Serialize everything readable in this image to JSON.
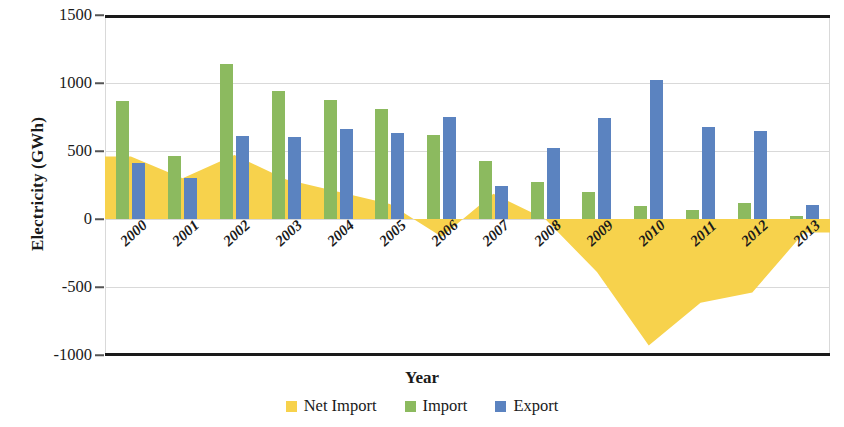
{
  "chart_data": {
    "type": "bar",
    "title": "",
    "xlabel": "Year",
    "ylabel": "Electricity  (GWh)",
    "ylim": [
      -1000,
      1500
    ],
    "ytick_values": [
      1500,
      1000,
      500,
      0,
      -500,
      -1000
    ],
    "ytick_labels": [
      "1500",
      "1000",
      "500",
      "0",
      "-500",
      "-1000"
    ],
    "grid": true,
    "legend_position": "bottom",
    "categories": [
      "2000",
      "2001",
      "2002",
      "2003",
      "2004",
      "2005",
      "2006",
      "2007",
      "2008",
      "2009",
      "2010",
      "2011",
      "2012",
      "2013"
    ],
    "series": [
      {
        "name": "Net Import",
        "type": "area",
        "color": "#f7d24c",
        "values": [
          460,
          300,
          470,
          290,
          200,
          110,
          -130,
          185,
          0,
          -390,
          -930,
          -615,
          -540,
          -100
        ]
      },
      {
        "name": "Import",
        "type": "bar",
        "color": "#8cba5f",
        "values": [
          865,
          460,
          1140,
          940,
          875,
          810,
          620,
          425,
          270,
          195,
          95,
          65,
          115,
          25
        ]
      },
      {
        "name": "Export",
        "type": "bar",
        "color": "#5b83c0",
        "values": [
          410,
          300,
          610,
          600,
          660,
          635,
          750,
          240,
          520,
          740,
          1025,
          675,
          650,
          105
        ]
      }
    ]
  },
  "axis": {
    "y_title": "Electricity  (GWh)",
    "x_title": "Year"
  },
  "legend": {
    "items": [
      {
        "label": "Net Import",
        "color": "#f7d24c"
      },
      {
        "label": "Import",
        "color": "#8cba5f"
      },
      {
        "label": "Export",
        "color": "#5b83c0"
      }
    ]
  }
}
